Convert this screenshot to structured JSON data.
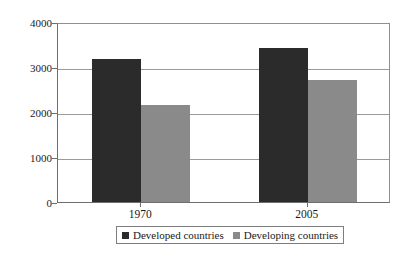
{
  "chart_data": {
    "type": "bar",
    "title": "",
    "subtitle": "",
    "xlabel": "",
    "ylabel": "",
    "categories": [
      "1970",
      "2005"
    ],
    "series": [
      {
        "name": "Developed countries",
        "color": "#2b2b2b",
        "values": [
          3180,
          3420
        ]
      },
      {
        "name": "Developing countries",
        "color": "#8a8a8a",
        "values": [
          2150,
          2720
        ]
      }
    ],
    "ylim": [
      0,
      4000
    ],
    "yticks": [
      0,
      1000,
      2000,
      3000,
      4000
    ],
    "ytick_labels": [
      "0",
      "1000",
      "2000",
      "3000",
      "4000"
    ],
    "grid": true,
    "grid_axis": "y",
    "legend_position": "bottom"
  },
  "axes": {
    "y": {
      "ticks": [
        {
          "value": 4000,
          "label": "4000"
        },
        {
          "value": 3000,
          "label": "3000"
        },
        {
          "value": 2000,
          "label": "2000"
        },
        {
          "value": 1000,
          "label": "1000"
        },
        {
          "value": 0,
          "label": "0"
        }
      ]
    },
    "x": {
      "ticks": [
        {
          "label": "1970"
        },
        {
          "label": "2005"
        }
      ]
    }
  },
  "legend": {
    "items": [
      {
        "label": "Developed countries",
        "color": "#2b2b2b"
      },
      {
        "label": "Developing countries",
        "color": "#8a8a8a"
      }
    ]
  },
  "colors": {
    "developed": "#2b2b2b",
    "developing": "#8a8a8a",
    "gridline": "#9a9a9a",
    "axis": "#6e6e6e",
    "background": "#ffffff"
  }
}
